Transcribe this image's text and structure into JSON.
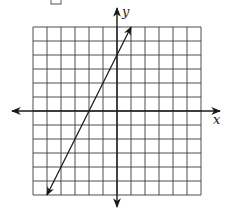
{
  "chart_data": {
    "type": "line",
    "title": "",
    "xlabel": "x",
    "ylabel": "y",
    "grid": true,
    "xlim": [
      -6,
      6
    ],
    "ylim": [
      -6,
      6
    ],
    "grid_step": 1,
    "series": [
      {
        "name": "line",
        "equation": "y = 2x + 4",
        "slope": 2,
        "y_intercept": 4,
        "x_intercept": -2,
        "x": [
          -5,
          1
        ],
        "y": [
          -6,
          6
        ],
        "arrows": "both"
      }
    ]
  },
  "axes": {
    "x_label": "x",
    "y_label": "y"
  },
  "colors": {
    "grid": "#3a3a3a",
    "axis": "#1a1a1a",
    "line": "#1a1a1a"
  }
}
